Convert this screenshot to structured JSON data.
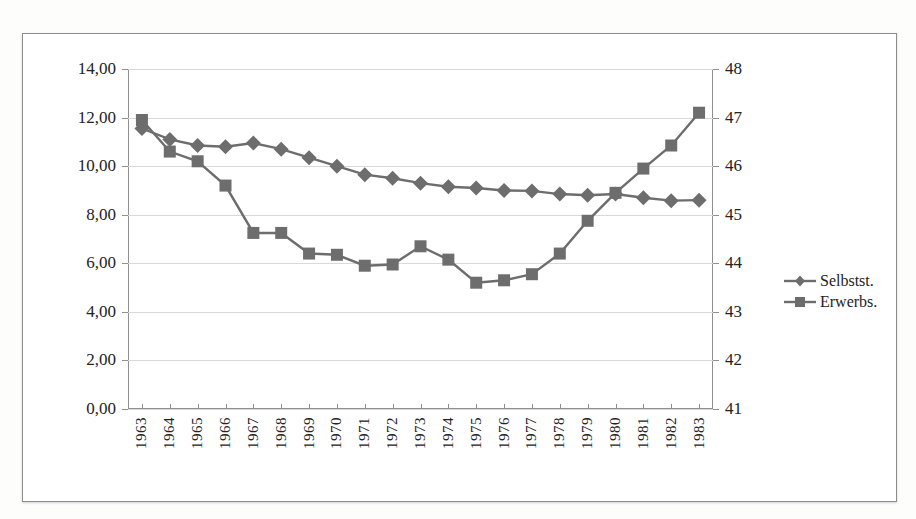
{
  "chart_data": {
    "type": "line",
    "title": "",
    "xlabel": "",
    "ylabel": "",
    "grid": true,
    "legend_position": "right",
    "categories": [
      "1963",
      "1964",
      "1965",
      "1966",
      "1967",
      "1968",
      "1969",
      "1970",
      "1971",
      "1972",
      "1973",
      "1974",
      "1975",
      "1976",
      "1977",
      "1978",
      "1979",
      "1980",
      "1981",
      "1982",
      "1983"
    ],
    "axes": {
      "left": {
        "ticks": [
          "0,00",
          "2,00",
          "4,00",
          "6,00",
          "8,00",
          "10,00",
          "12,00",
          "14,00"
        ],
        "values": [
          0,
          2,
          4,
          6,
          8,
          10,
          12,
          14
        ],
        "ylim": [
          0,
          14
        ],
        "decimal_separator": ","
      },
      "right": {
        "ticks": [
          "41",
          "42",
          "43",
          "44",
          "45",
          "46",
          "47",
          "48"
        ],
        "values": [
          41,
          42,
          43,
          44,
          45,
          46,
          47,
          48
        ],
        "ylim": [
          41,
          48
        ]
      }
    },
    "series": [
      {
        "name": "Selbstst.",
        "marker": "diamond",
        "axis": "left",
        "color": "#6d6d6d",
        "values": [
          11.55,
          11.1,
          10.85,
          10.8,
          10.95,
          10.7,
          10.35,
          10.0,
          9.65,
          9.5,
          9.3,
          9.15,
          9.1,
          9.0,
          8.98,
          8.85,
          8.8,
          8.85,
          8.7,
          8.58,
          8.6
        ]
      },
      {
        "name": "Erwerbs.",
        "marker": "square",
        "axis": "left",
        "color": "#6d6d6d",
        "values": [
          11.9,
          10.6,
          10.2,
          9.2,
          7.25,
          7.25,
          6.4,
          6.35,
          5.9,
          5.95,
          6.7,
          6.15,
          5.2,
          5.3,
          5.55,
          6.4,
          7.75,
          8.9,
          9.9,
          10.85,
          12.2
        ]
      }
    ]
  },
  "legend": {
    "items": [
      {
        "label": "Selbstst.",
        "marker": "diamond"
      },
      {
        "label": "Erwerbs.",
        "marker": "square"
      }
    ]
  },
  "colors": {
    "series": "#6d6d6d",
    "grid": "#d9d9d9",
    "axis": "#8f8f8f",
    "text": "#232323",
    "frame": "#8d8d8d",
    "background": "#ffffff",
    "page": "#fdfdfc"
  }
}
